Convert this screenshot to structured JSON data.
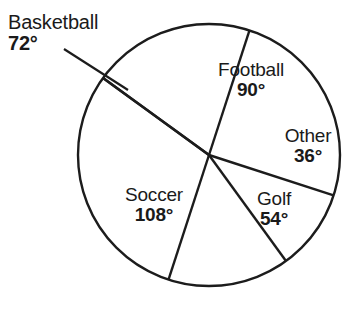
{
  "chart_data": {
    "type": "pie",
    "title": "",
    "subtitle": "",
    "xlabel": "",
    "ylabel": "",
    "legend": "none",
    "grid": false,
    "units": "degrees",
    "total_degrees": 360,
    "categories": [
      "Football",
      "Other",
      "Golf",
      "Soccer",
      "Basketball"
    ],
    "values": [
      90,
      36,
      54,
      108,
      72
    ],
    "labels": [
      "90°",
      "36°",
      "54°",
      "108°",
      "72°"
    ],
    "slices": [
      {
        "name": "Football",
        "value": 90,
        "value_label": "90°",
        "start_deg": -18,
        "end_deg": 72,
        "label_placement": "inside"
      },
      {
        "name": "Other",
        "value": 36,
        "value_label": "36°",
        "start_deg": -54,
        "end_deg": -18,
        "label_placement": "inside"
      },
      {
        "name": "Golf",
        "value": 54,
        "value_label": "54°",
        "start_deg": -108,
        "end_deg": -54,
        "label_placement": "inside"
      },
      {
        "name": "Soccer",
        "value": 108,
        "value_label": "108°",
        "start_deg": -216,
        "end_deg": -108,
        "label_placement": "inside"
      },
      {
        "name": "Basketball",
        "value": 72,
        "value_label": "72°",
        "start_deg": 72,
        "end_deg": 144,
        "label_placement": "outside-with-leader"
      }
    ],
    "colors": {
      "slice_fill": "#ffffff",
      "outline": "#1c1c1c",
      "text": "#1a1a1a",
      "background": "#ffffff"
    }
  },
  "chart": {
    "basketball": {
      "name": "Basketball",
      "value": "72°"
    },
    "football": {
      "name": "Football",
      "value": "90°"
    },
    "other": {
      "name": "Other",
      "value": "36°"
    },
    "golf": {
      "name": "Golf",
      "value": "54°"
    },
    "soccer": {
      "name": "Soccer",
      "value": "108°"
    }
  }
}
